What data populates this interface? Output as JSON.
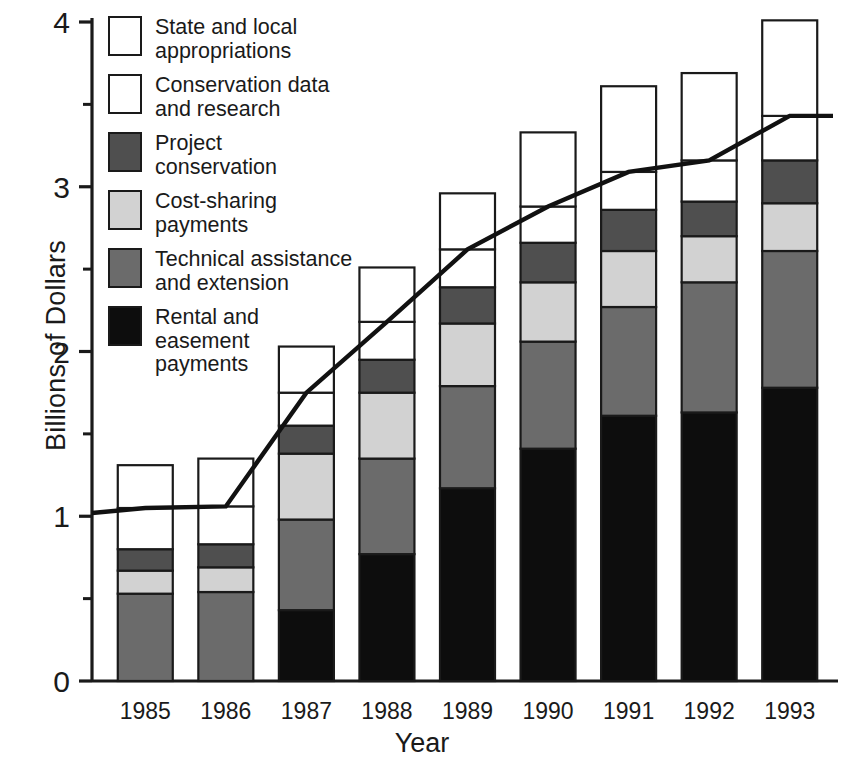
{
  "chart_data": {
    "type": "bar",
    "subtype": "stacked-bar-with-line-overlay",
    "title": "",
    "xlabel": "Year",
    "ylabel": "Billions of Dollars",
    "categories": [
      "1985",
      "1986",
      "1987",
      "1988",
      "1989",
      "1990",
      "1991",
      "1992",
      "1993"
    ],
    "ylim": [
      0,
      4
    ],
    "yticks": [
      0,
      1,
      2,
      3,
      4
    ],
    "ytick_labels": [
      "0",
      "1",
      "2",
      "3",
      "4"
    ],
    "yticks_minor": [
      0.5,
      1.5,
      2.5,
      3.5
    ],
    "grid": false,
    "legend_position": "upper-left inside plot",
    "series": [
      {
        "name": "Rental and easement payments",
        "color": "#0d0d0d",
        "values": [
          0,
          0,
          0.43,
          0.77,
          1.17,
          1.41,
          1.61,
          1.63,
          1.78
        ]
      },
      {
        "name": "Technical assistance and extension",
        "color": "#6b6b6b",
        "values": [
          0.53,
          0.54,
          0.55,
          0.58,
          0.62,
          0.65,
          0.66,
          0.79,
          0.83
        ]
      },
      {
        "name": "Cost-sharing payments",
        "color": "#d2d2d2",
        "values": [
          0.14,
          0.15,
          0.4,
          0.4,
          0.38,
          0.36,
          0.34,
          0.28,
          0.29
        ]
      },
      {
        "name": "Project conservation",
        "color": "#4f4f4f",
        "values": [
          0.13,
          0.14,
          0.17,
          0.2,
          0.22,
          0.24,
          0.25,
          0.21,
          0.26
        ]
      },
      {
        "name": "Conservation data and research",
        "color": "#ffffff",
        "values": [
          0.25,
          0.23,
          0.2,
          0.23,
          0.23,
          0.22,
          0.23,
          0.25,
          0.27
        ]
      },
      {
        "name": "State and local appropriations",
        "color": "#ffffff",
        "values": [
          0.26,
          0.29,
          0.28,
          0.33,
          0.34,
          0.45,
          0.52,
          0.53,
          0.58
        ]
      }
    ],
    "totals": [
      1.31,
      1.35,
      2.03,
      2.51,
      2.96,
      3.33,
      3.61,
      3.69,
      4.01
    ],
    "line_overlay": {
      "name": "Total excluding state and local appropriations",
      "color": "#111111",
      "x_start_at_axis": true,
      "y_at_axis": 1.02,
      "values": [
        1.05,
        1.06,
        1.75,
        2.18,
        2.62,
        2.88,
        3.09,
        3.16,
        3.43
      ],
      "extends_past_last_bar": true
    }
  },
  "axes": {
    "y_label": "Billions of Dollars",
    "x_label": "Year",
    "y_tick_labels": [
      "0",
      "1",
      "2",
      "3",
      "4"
    ],
    "x_tick_labels": [
      "1985",
      "1986",
      "1987",
      "1988",
      "1989",
      "1990",
      "1991",
      "1992",
      "1993"
    ]
  },
  "legend": {
    "items": [
      {
        "label": "State and local\nappropriations",
        "swatch": "#ffffff",
        "name": "state-and-local-appropriations"
      },
      {
        "label": "Conservation data\nand research",
        "swatch": "#ffffff",
        "name": "conservation-data-and-research"
      },
      {
        "label": "Project\nconservation",
        "swatch": "#4f4f4f",
        "name": "project-conservation"
      },
      {
        "label": "Cost-sharing\npayments",
        "swatch": "#d2d2d2",
        "name": "cost-sharing-payments"
      },
      {
        "label": "Technical assistance\nand extension",
        "swatch": "#6b6b6b",
        "name": "technical-assistance-and-extension"
      },
      {
        "label": "Rental and\neasement\npayments",
        "swatch": "#0d0d0d",
        "name": "rental-and-easement-payments"
      }
    ]
  }
}
